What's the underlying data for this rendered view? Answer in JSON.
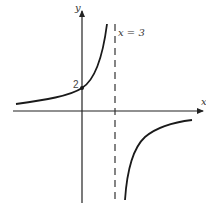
{
  "diagram": {
    "type": "function-graph",
    "axes": {
      "x_label": "x",
      "y_label": "y"
    },
    "asymptote": {
      "label": "x = 3",
      "style": "dashed"
    },
    "intercept": {
      "label": "2"
    },
    "colors": {
      "curve": "#1a1a1a",
      "axis": "#222222",
      "asymptote": "#333333",
      "text": "#333333"
    }
  }
}
